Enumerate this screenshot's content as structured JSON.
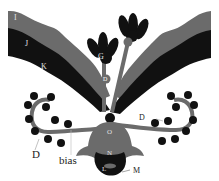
{
  "diagram": {
    "colors": {
      "black": "#111111",
      "gray": "#6b6b6b",
      "background": "#ffffff"
    },
    "labels": {
      "band_top": "I",
      "band_middle": "J",
      "band_bottom": "K",
      "bud_left": "G",
      "stem_node_left": "D",
      "dots_right": "D",
      "dots_left": "D",
      "bias": "bias",
      "center_upper": "O",
      "center_middle": "N",
      "center_lower": "L",
      "center_right": "M"
    }
  }
}
